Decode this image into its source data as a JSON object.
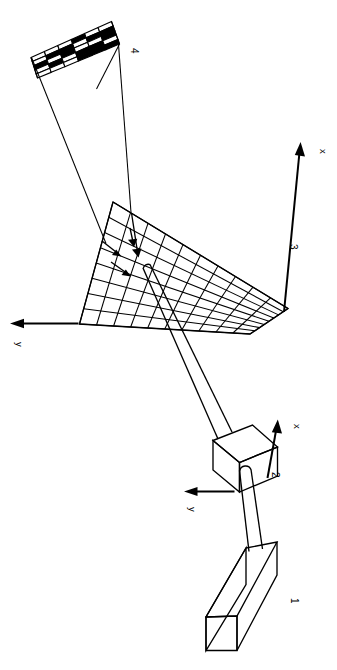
{
  "figure": {
    "orientation": "rotated-90",
    "background_color": "#ffffff",
    "ink_color": "#000000",
    "width_px": 337,
    "height_px": 670
  },
  "components": [
    {
      "id": "1",
      "label": "1",
      "name": "laser-source-box",
      "description": "rectangular box at lower right"
    },
    {
      "id": "2",
      "label": "2",
      "name": "scanner-head-cube",
      "description": "cube with local x and y axes"
    },
    {
      "id": "3",
      "label": "3",
      "name": "target-grid-plane",
      "description": "planar grid surface with global x and y axes"
    },
    {
      "id": "4",
      "label": "4",
      "name": "checkerboard-pattern",
      "description": "binary checkerboard image plane"
    }
  ],
  "axes": [
    {
      "name": "plane-x-axis",
      "label": "x",
      "belongs_to": "3"
    },
    {
      "name": "plane-y-axis",
      "label": "y",
      "belongs_to": "3"
    },
    {
      "name": "scanner-x-axis",
      "label": "x",
      "belongs_to": "2"
    },
    {
      "name": "scanner-y-axis",
      "label": "y",
      "belongs_to": "2"
    }
  ],
  "grid_plane": {
    "columns": 10,
    "rows": 8
  },
  "checkerboard": {
    "columns": 6,
    "rows": 5,
    "black_color": "#000000",
    "white_color": "#ffffff",
    "cells": [
      [
        0,
        0,
        0,
        1,
        0,
        0
      ],
      [
        0,
        1,
        1,
        0,
        1,
        1
      ],
      [
        1,
        0,
        1,
        0,
        0,
        1
      ],
      [
        0,
        1,
        0,
        1,
        1,
        0
      ],
      [
        0,
        0,
        0,
        1,
        1,
        1
      ]
    ]
  },
  "labels": {
    "component_1": "1",
    "component_2": "2",
    "component_3": "3",
    "component_4": "4",
    "plane_x": "x",
    "plane_y": "y",
    "scanner_x": "x",
    "scanner_y": "y"
  }
}
